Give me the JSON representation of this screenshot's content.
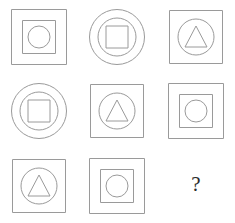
{
  "puzzle": {
    "title": "Matrix Reasoning Puzzle",
    "type": "ravens-progressive-matrix",
    "rows": 3,
    "columns": 3,
    "stroke_color": "#9a9a9a",
    "background_color": "#ffffff",
    "question_mark": "?",
    "question_mark_color": "#2b2b2b",
    "cells": [
      {
        "id": "cell-1",
        "row": 1,
        "column": 1,
        "layers": [
          "square",
          "square",
          "circle"
        ],
        "description": "outer square, inner square, innermost circle"
      },
      {
        "id": "cell-2",
        "row": 1,
        "column": 2,
        "layers": [
          "circle",
          "circle",
          "square"
        ],
        "description": "outer circle, inner circle, innermost square"
      },
      {
        "id": "cell-3",
        "row": 1,
        "column": 3,
        "layers": [
          "square",
          "circle",
          "triangle"
        ],
        "description": "outer square, inner circle, innermost triangle"
      },
      {
        "id": "cell-4",
        "row": 2,
        "column": 1,
        "layers": [
          "circle",
          "circle",
          "square"
        ],
        "description": "outer circle, inner circle, innermost square"
      },
      {
        "id": "cell-5",
        "row": 2,
        "column": 2,
        "layers": [
          "square",
          "circle",
          "triangle"
        ],
        "description": "outer square, inner circle, innermost triangle"
      },
      {
        "id": "cell-6",
        "row": 2,
        "column": 3,
        "layers": [
          "square",
          "square",
          "circle"
        ],
        "description": "outer square, inner square, innermost circle"
      },
      {
        "id": "cell-7",
        "row": 3,
        "column": 1,
        "layers": [
          "square",
          "circle",
          "triangle"
        ],
        "description": "outer square, inner circle, innermost triangle"
      },
      {
        "id": "cell-8",
        "row": 3,
        "column": 2,
        "layers": [
          "square",
          "square",
          "circle"
        ],
        "description": "outer square, inner square, innermost circle"
      },
      {
        "id": "cell-9",
        "row": 3,
        "column": 3,
        "layers": [],
        "description": "missing element, shown as question mark"
      }
    ]
  }
}
